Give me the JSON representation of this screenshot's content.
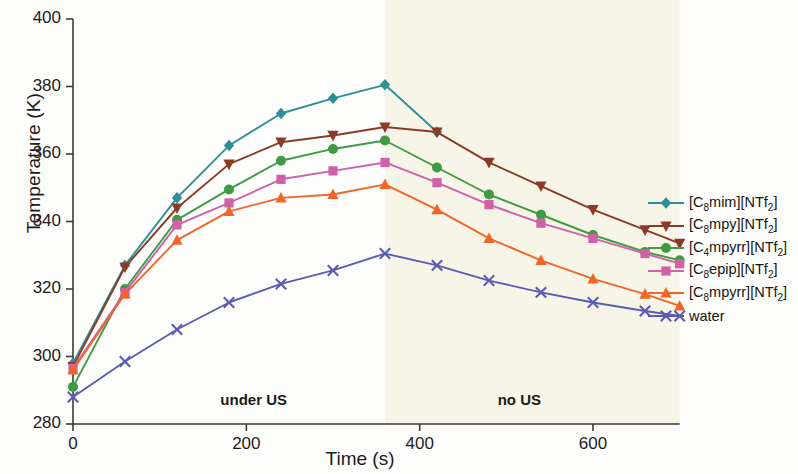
{
  "chart_data": {
    "type": "line",
    "title": "",
    "xlabel": "Time (s)",
    "ylabel": "Temperature (K)",
    "xlim": [
      0,
      700
    ],
    "ylim": [
      280,
      400
    ],
    "xticks": [
      0,
      200,
      400,
      600
    ],
    "yticks": [
      280,
      300,
      320,
      340,
      360,
      380,
      400
    ],
    "grid": false,
    "legend_position": "right",
    "x": [
      0,
      60,
      120,
      180,
      240,
      300,
      360,
      420,
      480,
      540,
      600,
      660,
      700
    ],
    "annotations": [
      {
        "text": "under US",
        "x": 170,
        "y": 287
      },
      {
        "text": "no US",
        "x": 490,
        "y": 287
      }
    ],
    "shaded_region": {
      "label": "no US",
      "x_start": 360,
      "x_end": 700,
      "color": "#f7f5e7"
    },
    "series": [
      {
        "name": "[C8mim][NTf2]",
        "label_html": "[C<sub>8</sub>mim][NTf<sub>2</sub>]",
        "color": "#2e8f96",
        "marker": "diamond",
        "x": [
          0,
          60,
          120,
          180,
          240,
          300,
          360,
          420
        ],
        "values": [
          298,
          327,
          347,
          362.5,
          372,
          376.5,
          380.5,
          366.5
        ]
      },
      {
        "name": "[C8mpy][NTf2]",
        "label_html": "[C<sub>8</sub>mpy][NTf<sub>2</sub>]",
        "color": "#8c3a26",
        "marker": "triangle-down",
        "x": [
          0,
          60,
          120,
          180,
          240,
          300,
          360,
          420,
          480,
          540,
          600,
          660,
          700
        ],
        "values": [
          297,
          326.5,
          344,
          357,
          363.5,
          365.5,
          368,
          366.5,
          357.5,
          350.5,
          343.5,
          337.5,
          333.5
        ]
      },
      {
        "name": "[C4mpyrr][NTf2]",
        "label_html": "[C<sub>4</sub>mpyrr][NTf<sub>2</sub>]",
        "color": "#3f9b42",
        "marker": "circle",
        "x": [
          0,
          60,
          120,
          180,
          240,
          300,
          360,
          420,
          480,
          540,
          600,
          660,
          700
        ],
        "values": [
          291,
          320,
          340.5,
          349.5,
          358,
          361.5,
          364,
          356,
          348,
          342,
          336,
          331,
          328.5
        ]
      },
      {
        "name": "[C8epip][NTf2]",
        "label_html": "[C<sub>8</sub>epip][NTf<sub>2</sub>]",
        "color": "#d060a8",
        "marker": "square",
        "x": [
          0,
          60,
          120,
          180,
          240,
          300,
          360,
          420,
          480,
          540,
          600,
          660,
          700
        ],
        "values": [
          296.5,
          319,
          339,
          345.5,
          352.5,
          355,
          357.5,
          351.5,
          345,
          339.5,
          335,
          330.5,
          327.5
        ]
      },
      {
        "name": "[C8mpyrr][NTf2]",
        "label_html": "[C<sub>8</sub>mpyrr][NTf<sub>2</sub>]",
        "color": "#f2652a",
        "marker": "triangle-up",
        "x": [
          0,
          60,
          120,
          180,
          240,
          300,
          360,
          420,
          480,
          540,
          600,
          660,
          700
        ],
        "values": [
          296,
          318.5,
          334.5,
          343,
          347,
          348,
          351,
          343.5,
          335,
          328.5,
          323,
          318.5,
          315
        ]
      },
      {
        "name": "water",
        "label_html": "water",
        "color": "#5b5bb5",
        "marker": "x",
        "x": [
          0,
          60,
          120,
          180,
          240,
          300,
          360,
          420,
          480,
          540,
          600,
          660,
          700
        ],
        "values": [
          288,
          298.5,
          308,
          316,
          321.5,
          325.5,
          330.5,
          327,
          322.5,
          319,
          316,
          313.5,
          312
        ]
      }
    ]
  }
}
